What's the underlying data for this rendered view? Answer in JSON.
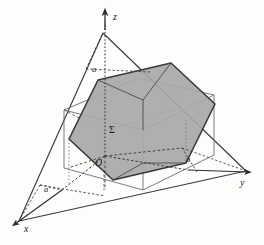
{
  "figure": {
    "type": "3d-geometry-diagram",
    "background_color": "#fdfdfc",
    "shade_color": "#a8a8a8",
    "line_color": "#3a3a3a",
    "thin_line_color": "#6e6e6e",
    "labels": {
      "axis_z": "z",
      "axis_y": "y",
      "axis_x": "x",
      "origin": "O",
      "surface": "Σ",
      "a_top": "a",
      "a_right": "a",
      "a_left": "a"
    },
    "elements": {
      "axes": [
        "x",
        "y",
        "z"
      ],
      "solids": [
        "cube",
        "hexagonal-cross-section",
        "cutting-plane-triangle"
      ],
      "shaded_region": "Σ"
    }
  }
}
